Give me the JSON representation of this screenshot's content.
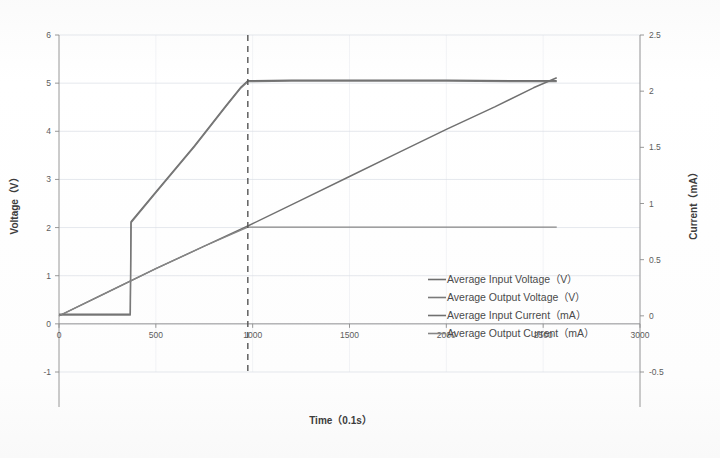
{
  "chart_data": {
    "type": "line",
    "title": "",
    "xlabel": "Time（0.1s）",
    "ylabel": "Voltage（V）",
    "y2label": "Current（mA）",
    "xlim": [
      0,
      3000
    ],
    "ylim": [
      -1,
      6
    ],
    "y2lim": [
      -0.5,
      2.5
    ],
    "xticks": [
      "0",
      "500",
      "1000",
      "1500",
      "2000",
      "2500",
      "3000"
    ],
    "xtick_values": [
      0,
      500,
      1000,
      1500,
      2000,
      2500,
      3000
    ],
    "yticks": [
      "-1",
      "0",
      "1",
      "2",
      "3",
      "4",
      "5",
      "6"
    ],
    "ytick_values": [
      -1,
      0,
      1,
      2,
      3,
      4,
      5,
      6
    ],
    "y2ticks": [
      "-0.5",
      "0",
      "0.5",
      "1",
      "1.5",
      "2",
      "2.5"
    ],
    "y2tick_values": [
      -0.5,
      0,
      0.5,
      1,
      1.5,
      2,
      2.5
    ],
    "grid": true,
    "legend_position": "center-right",
    "annotations": [
      {
        "name": "reference-line",
        "type": "vline",
        "x": 975,
        "style": "dashed"
      }
    ],
    "series": [
      {
        "name": "Average Input Voltage（V）",
        "axis": "left",
        "unit": "V",
        "color": "#6e6e6e",
        "points": [
          [
            0,
            0.2
          ],
          [
            120,
            0.2
          ],
          [
            300,
            0.2
          ],
          [
            368,
            0.2
          ],
          [
            372,
            2.12
          ],
          [
            500,
            2.74
          ],
          [
            700,
            3.7
          ],
          [
            860,
            4.52
          ],
          [
            940,
            4.92
          ],
          [
            975,
            5.05
          ],
          [
            1200,
            5.06
          ],
          [
            1600,
            5.06
          ],
          [
            2000,
            5.06
          ],
          [
            2400,
            5.05
          ],
          [
            2570,
            5.05
          ]
        ]
      },
      {
        "name": "Average Output Voltage（V）",
        "axis": "left",
        "unit": "V",
        "color": "#7a7a7a",
        "points": [
          [
            0,
            0.18
          ],
          [
            120,
            0.18
          ],
          [
            300,
            0.18
          ],
          [
            368,
            0.18
          ],
          [
            372,
            2.1
          ],
          [
            500,
            2.72
          ],
          [
            700,
            3.68
          ],
          [
            860,
            4.5
          ],
          [
            940,
            4.9
          ],
          [
            975,
            5.03
          ],
          [
            1200,
            5.04
          ],
          [
            1600,
            5.04
          ],
          [
            2000,
            5.04
          ],
          [
            2400,
            5.03
          ],
          [
            2570,
            5.03
          ]
        ]
      },
      {
        "name": "Average Input Current（mA）",
        "axis": "right",
        "unit": "mA",
        "color": "#707070",
        "points": [
          [
            0,
            0.0
          ],
          [
            250,
            0.21
          ],
          [
            500,
            0.42
          ],
          [
            750,
            0.62
          ],
          [
            975,
            0.8
          ],
          [
            1250,
            1.03
          ],
          [
            1500,
            1.24
          ],
          [
            1750,
            1.45
          ],
          [
            2000,
            1.66
          ],
          [
            2250,
            1.86
          ],
          [
            2450,
            2.03
          ],
          [
            2570,
            2.12
          ]
        ]
      },
      {
        "name": "Average Output Current（mA）",
        "axis": "right",
        "unit": "mA",
        "color": "#868686",
        "points": [
          [
            0,
            0.0
          ],
          [
            250,
            0.21
          ],
          [
            500,
            0.42
          ],
          [
            750,
            0.62
          ],
          [
            975,
            0.79
          ],
          [
            1200,
            0.79
          ],
          [
            1600,
            0.79
          ],
          [
            2000,
            0.79
          ],
          [
            2400,
            0.79
          ],
          [
            2570,
            0.79
          ]
        ]
      }
    ]
  },
  "legend": {
    "items": [
      {
        "label": "Average Input Voltage（V）",
        "color": "#6e6e6e"
      },
      {
        "label": "Average Output Voltage（V）",
        "color": "#7a7a7a"
      },
      {
        "label": "Average Input Current（mA）",
        "color": "#707070"
      },
      {
        "label": "Average Output Current（mA）",
        "color": "#868686"
      }
    ]
  }
}
